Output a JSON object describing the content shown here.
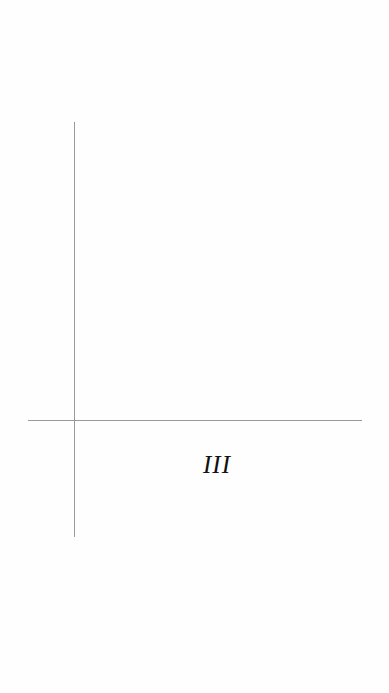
{
  "diagram": {
    "type": "coordinate-axes",
    "quadrant_label": "III",
    "colors": {
      "axis": "#9a9a9a",
      "label": "#111111",
      "background": "#fefefe"
    }
  }
}
